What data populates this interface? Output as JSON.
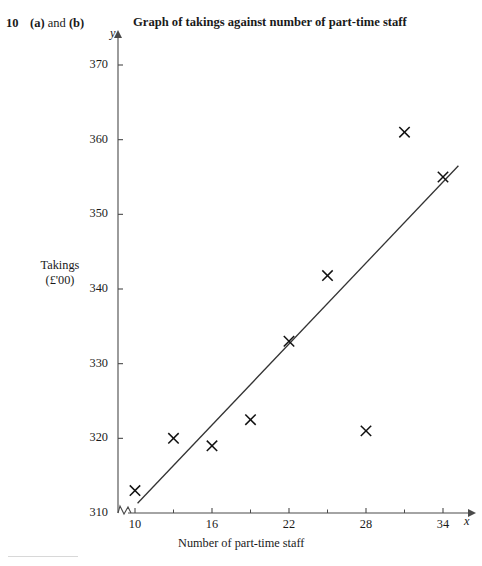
{
  "header": {
    "question_number": "10",
    "parts_prefix": "(a)",
    "parts_joiner": " and ",
    "parts_suffix": "(b)",
    "chart_title": "Graph of takings against number of part-time staff"
  },
  "chart_data": {
    "type": "scatter",
    "title": "Graph of takings against number of part-time staff",
    "xlabel": "Number of part-time staff",
    "ylabel": "Takings (£'00)",
    "ylabel_line1": "Takings",
    "ylabel_line2": "(£'00)",
    "x_axis_letter": "x",
    "y_axis_letter": "y",
    "xlim": [
      9,
      36
    ],
    "ylim": [
      310,
      374
    ],
    "axis_break": true,
    "grid": false,
    "legend": "none",
    "x_ticks_major": [
      10,
      16,
      22,
      28,
      34
    ],
    "x_tick_labels": [
      "10",
      "16",
      "22",
      "28",
      "34"
    ],
    "x_ticks_minor": [
      13,
      19,
      25,
      31
    ],
    "y_ticks_major": [
      310,
      320,
      330,
      340,
      350,
      360,
      370
    ],
    "y_tick_labels": [
      "310",
      "320",
      "330",
      "340",
      "350",
      "360",
      "370"
    ],
    "marker": "x-cross",
    "points": [
      {
        "x": 10,
        "y": 313
      },
      {
        "x": 13,
        "y": 320
      },
      {
        "x": 16,
        "y": 319
      },
      {
        "x": 19,
        "y": 322.5
      },
      {
        "x": 22,
        "y": 333
      },
      {
        "x": 25,
        "y": 341.8
      },
      {
        "x": 28,
        "y": 321
      },
      {
        "x": 31,
        "y": 361
      },
      {
        "x": 34,
        "y": 355
      }
    ],
    "trend_line": {
      "name": "line of best fit",
      "x1": 10.2,
      "y1": 311.3,
      "x2": 35.2,
      "y2": 356.5
    },
    "colors": {
      "axis": "#4a4a4a",
      "marker": "#111111",
      "line": "#333333",
      "text": "#1a1a1a"
    }
  }
}
